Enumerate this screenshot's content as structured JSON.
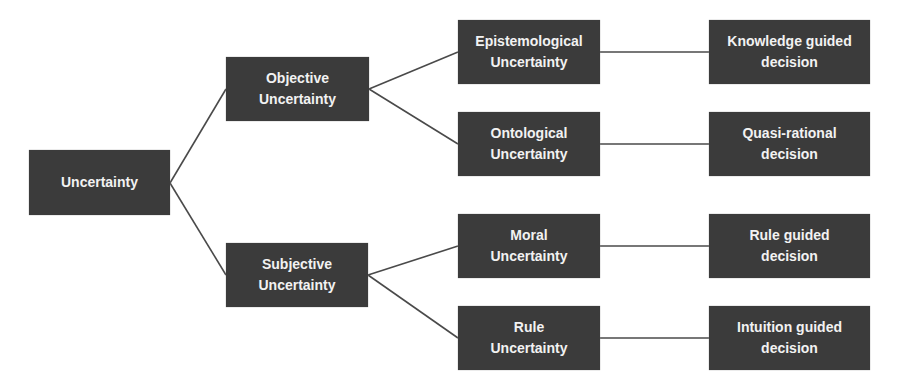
{
  "diagram": {
    "type": "tree",
    "orientation": "left-to-right",
    "colors": {
      "node_fill": "#3b3b3b",
      "node_text": "#f2f2f2",
      "edge": "#4a4a4a",
      "background": "#ffffff"
    },
    "nodes": {
      "root": {
        "label": "Uncertainty"
      },
      "objective": {
        "label": "Objective\nUncertainty"
      },
      "subjective": {
        "label": "Subjective\nUncertainty"
      },
      "epistemological": {
        "label": "Epistemological\nUncertainty"
      },
      "ontological": {
        "label": "Ontological\nUncertainty"
      },
      "moral": {
        "label": "Moral\nUncertainty"
      },
      "rule": {
        "label": "Rule\nUncertainty"
      },
      "knowledge_decision": {
        "label": "Knowledge guided\ndecision"
      },
      "quasi_decision": {
        "label": "Quasi-rational\ndecision"
      },
      "rule_decision": {
        "label": "Rule guided\ndecision"
      },
      "intuition_decision": {
        "label": "Intuition guided\ndecision"
      }
    },
    "edges": [
      [
        "root",
        "objective"
      ],
      [
        "root",
        "subjective"
      ],
      [
        "objective",
        "epistemological"
      ],
      [
        "objective",
        "ontological"
      ],
      [
        "subjective",
        "moral"
      ],
      [
        "subjective",
        "rule"
      ],
      [
        "epistemological",
        "knowledge_decision"
      ],
      [
        "ontological",
        "quasi_decision"
      ],
      [
        "moral",
        "rule_decision"
      ],
      [
        "rule",
        "intuition_decision"
      ]
    ]
  }
}
